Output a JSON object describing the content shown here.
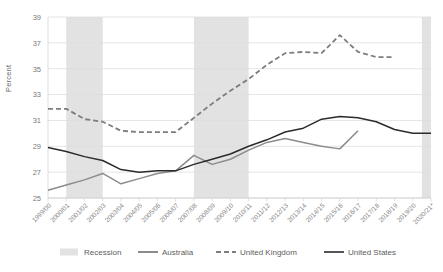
{
  "chart_data": {
    "type": "line",
    "title": "",
    "xlabel": "",
    "ylabel": "Percent",
    "ylim": [
      25,
      39
    ],
    "yticks": [
      25,
      27,
      29,
      31,
      33,
      35,
      37,
      39
    ],
    "grid": true,
    "legend_position": "bottom",
    "categories": [
      "1999/00",
      "2000/01",
      "2001/02",
      "2002/03",
      "2003/04",
      "2004/05",
      "2005/06",
      "2006/07",
      "2007/08",
      "2008/09",
      "2009/10",
      "2010/11",
      "2011/12",
      "2012/13",
      "2013/14",
      "2014/15",
      "2015/16",
      "2016/17",
      "2017/18",
      "2018/19",
      "2019/20",
      "2020/21*"
    ],
    "series": [
      {
        "name": "Australia",
        "style": "solid",
        "color": "#8c8c8c",
        "values": [
          25.6,
          26.0,
          26.4,
          26.9,
          26.1,
          26.5,
          26.9,
          27.1,
          28.3,
          27.6,
          28.0,
          28.7,
          29.3,
          29.6,
          29.3,
          29.0,
          28.8,
          30.2,
          null,
          null,
          null,
          null
        ]
      },
      {
        "name": "United Kingdom",
        "style": "dashed",
        "color": "#7d7d7d",
        "values": [
          31.9,
          31.9,
          31.1,
          30.9,
          30.2,
          30.1,
          30.1,
          30.1,
          31.2,
          32.3,
          33.3,
          34.2,
          35.3,
          36.2,
          36.3,
          36.2,
          37.6,
          36.3,
          35.9,
          35.9,
          null,
          null
        ]
      },
      {
        "name": "United States",
        "style": "solid",
        "color": "#2b2b2b",
        "values": [
          28.9,
          28.6,
          28.2,
          27.9,
          27.2,
          27.0,
          27.1,
          27.1,
          27.6,
          28.0,
          28.4,
          29.0,
          29.5,
          30.1,
          30.4,
          31.1,
          31.3,
          31.2,
          30.9,
          30.3,
          30.0,
          30.0
        ]
      }
    ],
    "recession_bands": [
      {
        "label": "Recession",
        "start": "2000/01",
        "end": "2002/03"
      },
      {
        "label": "Recession",
        "start": "2007/08",
        "end": "2010/11"
      },
      {
        "label": "Recession",
        "start": "2020/21*",
        "end": "2020/21*"
      }
    ],
    "recession_color": "#e2e2e2",
    "legend": [
      {
        "label": "Recession",
        "marker": "band"
      },
      {
        "label": "Australia",
        "marker": "solid-gray"
      },
      {
        "label": "United Kingdom",
        "marker": "dashed-gray"
      },
      {
        "label": "United States",
        "marker": "solid-black"
      }
    ]
  }
}
